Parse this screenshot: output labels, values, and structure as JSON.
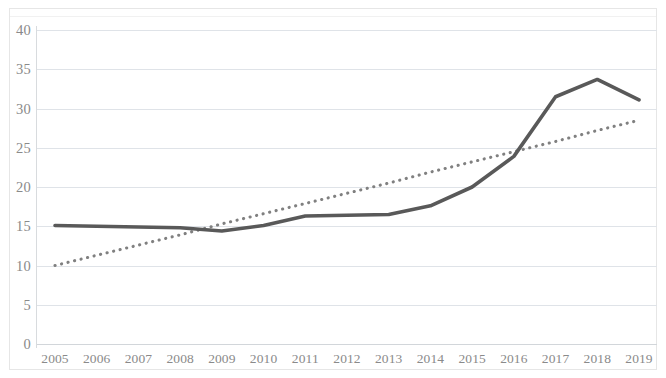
{
  "chart_data": {
    "type": "line",
    "title": "",
    "subtitle": "",
    "xlabel": "",
    "ylabel": "",
    "categories": [
      "2005",
      "2006",
      "2007",
      "2008",
      "2009",
      "2010",
      "2011",
      "2012",
      "2013",
      "2014",
      "2015",
      "2016",
      "2017",
      "2018",
      "2019"
    ],
    "series": [
      {
        "name": "data-series",
        "style": "solid",
        "color": "#595959",
        "values": [
          15.1,
          15.0,
          14.9,
          14.8,
          14.4,
          15.1,
          16.3,
          16.4,
          16.5,
          17.6,
          20.0,
          23.9,
          31.5,
          33.7,
          31.1
        ]
      },
      {
        "name": "trendline",
        "style": "dotted",
        "color": "#808080",
        "values": [
          10.0,
          11.3,
          12.6,
          13.9,
          15.3,
          16.6,
          17.9,
          19.2,
          20.5,
          21.9,
          23.2,
          24.5,
          25.8,
          27.2,
          28.5
        ]
      }
    ],
    "ylim": [
      0,
      40
    ],
    "ytick_step": 5,
    "yticks": [
      "0",
      "5",
      "10",
      "15",
      "20",
      "25",
      "30",
      "35",
      "40"
    ],
    "grid": true,
    "grid_axis": "y",
    "legend": false,
    "legend_position": "none",
    "colors": {
      "series_line": "#595959",
      "trendline": "#808080",
      "gridline": "#dfe3e8",
      "axis_text": "#8a8a8a",
      "background": "#ffffff",
      "frame": "#e6e6e6"
    }
  }
}
